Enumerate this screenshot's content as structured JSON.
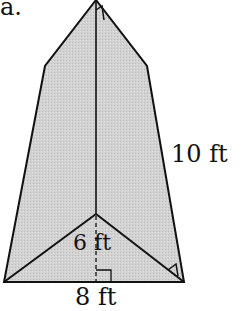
{
  "figure": {
    "part_label": "a.",
    "shape": "triangular pyramid (net-like view)",
    "fill_color": "#d4d4d4",
    "stroke_color": "#111111",
    "labels": {
      "slant_height": "10 ft",
      "base_triangle_height": "6 ft",
      "base_edge": "8 ft"
    }
  }
}
